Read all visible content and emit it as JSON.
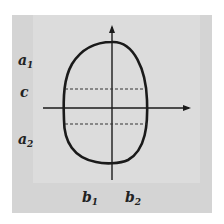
{
  "diagram": {
    "type": "closed-curve-on-axes",
    "left_labels": [
      {
        "base": "a",
        "sub": "1"
      },
      {
        "base": "c",
        "sub": ""
      },
      {
        "base": "a",
        "sub": "2"
      }
    ],
    "bottom_labels": [
      {
        "base": "b",
        "sub": "1"
      },
      {
        "base": "b",
        "sub": "2"
      }
    ],
    "colors": {
      "background": "#ffffff",
      "panel": "#d4d4d4",
      "inner_panel": "#dcdcdc",
      "stroke": "#1a1a1a"
    },
    "elements": [
      "vertical-axis-arrow",
      "horizontal-axis-arrow",
      "egg-shaped-curve",
      "upper-dashed-line",
      "lower-dashed-line"
    ]
  }
}
